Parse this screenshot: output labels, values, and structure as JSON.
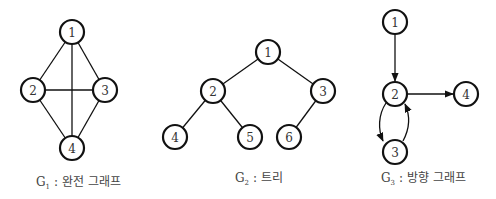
{
  "colors": {
    "stroke": "#111111",
    "text": "#333333",
    "background": "#ffffff"
  },
  "graphs": [
    {
      "id": "G1",
      "caption": {
        "letter": "G",
        "sub": "1",
        "sep": " : ",
        "label": "완전 그래프"
      },
      "directed": false,
      "nodes": [
        {
          "id": "1",
          "x": 72,
          "y": 32
        },
        {
          "id": "2",
          "x": 33,
          "y": 90
        },
        {
          "id": "3",
          "x": 105,
          "y": 90
        },
        {
          "id": "4",
          "x": 72,
          "y": 148
        }
      ],
      "edges": [
        [
          "1",
          "2"
        ],
        [
          "1",
          "3"
        ],
        [
          "1",
          "4"
        ],
        [
          "2",
          "3"
        ],
        [
          "2",
          "4"
        ],
        [
          "3",
          "4"
        ]
      ]
    },
    {
      "id": "G2",
      "caption": {
        "letter": "G",
        "sub": "2",
        "sep": " : ",
        "label": "트리"
      },
      "directed": false,
      "nodes": [
        {
          "id": "1",
          "x": 268,
          "y": 52
        },
        {
          "id": "2",
          "x": 213,
          "y": 91
        },
        {
          "id": "3",
          "x": 323,
          "y": 91
        },
        {
          "id": "4",
          "x": 175,
          "y": 137
        },
        {
          "id": "5",
          "x": 250,
          "y": 137
        },
        {
          "id": "6",
          "x": 289,
          "y": 137
        }
      ],
      "edges": [
        [
          "1",
          "2"
        ],
        [
          "1",
          "3"
        ],
        [
          "2",
          "4"
        ],
        [
          "2",
          "5"
        ],
        [
          "3",
          "6"
        ]
      ]
    },
    {
      "id": "G3",
      "caption": {
        "letter": "G",
        "sub": "3",
        "sep": " : ",
        "label": "방향 그래프"
      },
      "directed": true,
      "nodes": [
        {
          "id": "1",
          "x": 395,
          "y": 22
        },
        {
          "id": "2",
          "x": 395,
          "y": 94
        },
        {
          "id": "3",
          "x": 395,
          "y": 152
        },
        {
          "id": "4",
          "x": 466,
          "y": 94
        }
      ],
      "edges": [
        [
          "1",
          "2"
        ],
        [
          "2",
          "4"
        ],
        [
          "2",
          "3"
        ],
        [
          "3",
          "2"
        ]
      ]
    }
  ]
}
